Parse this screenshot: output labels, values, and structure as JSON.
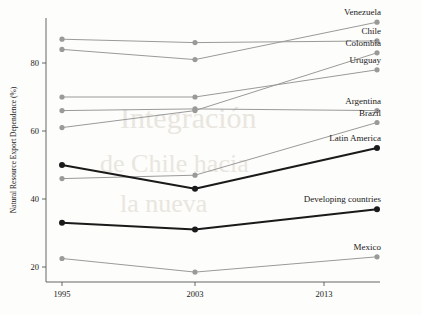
{
  "chart_data": {
    "type": "line",
    "title": "",
    "xlabel": "",
    "ylabel": "Natural Resource Export Dependence (%)",
    "x": [
      1995,
      2003,
      2013
    ],
    "xtick_labels": [
      "1995",
      "2003",
      "2013"
    ],
    "ytick_labels": [
      "20",
      "40",
      "60",
      "80"
    ],
    "ytick_values": [
      20,
      40,
      60,
      80
    ],
    "ylim": [
      14,
      95
    ],
    "xlim": [
      1993,
      2017
    ],
    "grid": false,
    "legend_position": "right-inline-labels",
    "series": [
      {
        "name": "Venezuela",
        "label": "Venezuela",
        "values": [
          84.0,
          81.0,
          92.0
        ],
        "color": "#9a9a9a",
        "emphasis": false
      },
      {
        "name": "Chile",
        "label": "Chile",
        "values": [
          87.0,
          86.0,
          86.5
        ],
        "color": "#9a9a9a",
        "emphasis": false
      },
      {
        "name": "Colombia",
        "label": "Colombia",
        "values": [
          61.0,
          66.0,
          83.0
        ],
        "color": "#9a9a9a",
        "emphasis": false
      },
      {
        "name": "Uruguay",
        "label": "Uruguay",
        "values": [
          70.0,
          70.0,
          78.0
        ],
        "color": "#9a9a9a",
        "emphasis": false
      },
      {
        "name": "Argentina",
        "label": "Argentina",
        "values": [
          66.0,
          66.5,
          66.0
        ],
        "color": "#9a9a9a",
        "emphasis": false
      },
      {
        "name": "Brazil",
        "label": "Brazil",
        "values": [
          46.0,
          47.0,
          62.5
        ],
        "color": "#9a9a9a",
        "emphasis": false
      },
      {
        "name": "Latin America",
        "label": "Latin America",
        "values": [
          50.0,
          43.0,
          55.0
        ],
        "color": "#1a1a1a",
        "emphasis": true
      },
      {
        "name": "Developing countries",
        "label": "Developing countries",
        "values": [
          33.0,
          31.0,
          37.0
        ],
        "color": "#1a1a1a",
        "emphasis": true
      },
      {
        "name": "Mexico",
        "label": "Mexico",
        "values": [
          22.5,
          18.5,
          23.0
        ],
        "color": "#9a9a9a",
        "emphasis": false
      }
    ]
  },
  "colors": {
    "background": "#fdfdfb",
    "axis": "#555555",
    "muted_series": "#9a9a9a",
    "emphasis_series": "#1a1a1a",
    "text": "#1a1a1a",
    "bleed_through": "#e9e6df"
  },
  "bleed_through": {
    "line1": "Integración",
    "line2": "de Chile hacia",
    "line3": "la nueva"
  }
}
